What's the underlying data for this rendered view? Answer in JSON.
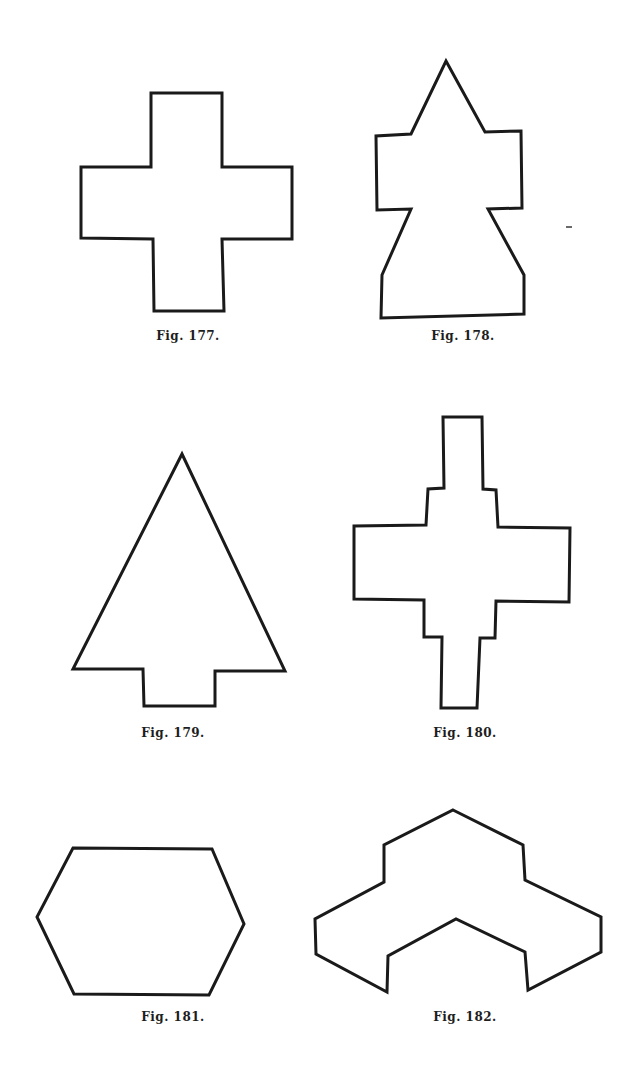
{
  "page": {
    "background": "#ffffff",
    "ink_color": "#1a1a1a"
  },
  "figures": [
    {
      "id": "fig-177",
      "caption": "Fig. 177.",
      "shape": "Greek cross",
      "points": "151,93 222,93 222,167 292,167 292,239 222,239 224,311 154,311 153,239 81,238 81,167 151,167",
      "caption_pos": {
        "x": 188,
        "y": 329
      }
    },
    {
      "id": "fig-178",
      "caption": "Fig. 178.",
      "shape": "Arrow-headed bottle",
      "points": "446,61 485,132 521,131 522,208 488,209 524,275 524,314 381,318 382,275 411,209 377,210 376,136 411,134",
      "caption_pos": {
        "x": 463,
        "y": 329
      }
    },
    {
      "id": "fig-179",
      "caption": "Fig. 179.",
      "shape": "Tree / arrow triangle with stem",
      "points": "182,454 285,671 215,671 215,706 144,706 143,669 73,669",
      "caption_pos": {
        "x": 173,
        "y": 726
      }
    },
    {
      "id": "fig-180",
      "caption": "Fig. 180.",
      "shape": "Stepped cross",
      "points": "443,417 482,417 483,489 496,490 498,527 570,528 569,602 496,601 495,638 480,638 477,708 441,708 442,637 424,637 424,600 354,599 354,526 426,525 428,489 444,488",
      "caption_pos": {
        "x": 465,
        "y": 726
      }
    },
    {
      "id": "fig-181",
      "caption": "Fig. 181.",
      "shape": "Hexagon",
      "points": "73,848 212,849 244,924 209,995 74,994 37,917",
      "caption_pos": {
        "x": 173,
        "y": 1010
      }
    },
    {
      "id": "fig-182",
      "caption": "Fig. 182.",
      "shape": "Isometric chevron block",
      "points": "453,810 523,845 525,880 601,917 601,952 528,990 525,952 456,919 388,956 387,992 316,954 315,919 384,882 384,845",
      "caption_pos": {
        "x": 465,
        "y": 1010
      }
    }
  ]
}
